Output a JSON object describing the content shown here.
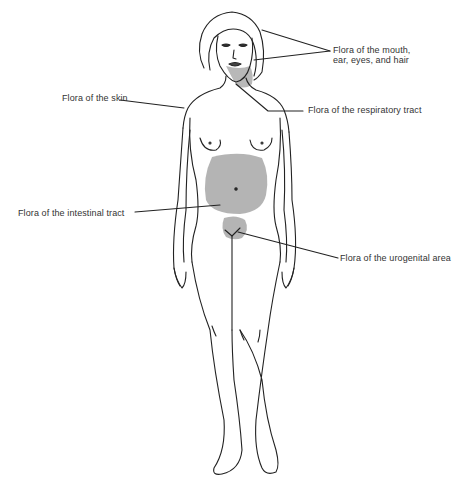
{
  "diagram": {
    "colors": {
      "line": "#222222",
      "shade": "#b4b4b4",
      "background": "#ffffff"
    },
    "labels": [
      {
        "id": "mouth",
        "line1": "Flora of the mouth,",
        "line2": "ear, eyes, and hair"
      },
      {
        "id": "skin",
        "line1": "Flora of the skin"
      },
      {
        "id": "respiratory",
        "line1": "Flora of the respiratory tract"
      },
      {
        "id": "intestinal",
        "line1": "Flora of the intestinal tract"
      },
      {
        "id": "urogenital",
        "line1": "Flora of the urogenital area"
      }
    ]
  }
}
